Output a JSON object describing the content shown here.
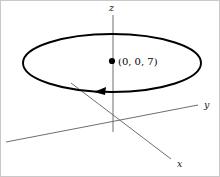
{
  "figure": {
    "background_color": "#ffffff",
    "border_color": "#c9c9c9",
    "stroke_color": "#000000",
    "axis_color": "#6e6e6e"
  },
  "axes": {
    "z": {
      "label": "z",
      "label_x": 108,
      "label_y": 10,
      "x1": 112,
      "y1": 14,
      "x2": 112,
      "y2": 131
    },
    "y": {
      "label": "y",
      "label_x": 203,
      "label_y": 107,
      "x1": 5,
      "y1": 141,
      "x2": 197,
      "y2": 104
    },
    "x": {
      "label": "x",
      "label_x": 176,
      "label_y": 166,
      "x1": 70,
      "y1": 82,
      "x2": 170,
      "y2": 158
    }
  },
  "curve": {
    "name": "circle",
    "center_x": 111,
    "center_y": 62,
    "radius_x": 89,
    "radius_y": 29,
    "direction": "counterclockwise"
  },
  "arrow": {
    "name": "orientation-arrow",
    "tip_x": 93,
    "tip_y": 91,
    "points": "93,91 105,86 104,94"
  },
  "point": {
    "label": "(0, 0, 7)",
    "dot_x": 111,
    "dot_y": 60,
    "dot_radius": 3.1,
    "label_x": 117,
    "label_y": 64
  }
}
